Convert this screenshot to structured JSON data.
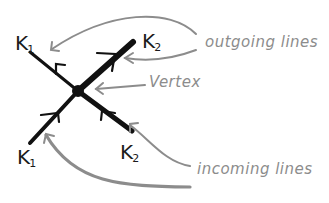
{
  "diagram": {
    "type": "feynman-vertex",
    "colors": {
      "line": "#111111",
      "annotation": "#8c8c8c",
      "background": "#ffffff"
    },
    "vertex": {
      "label": "Vertex",
      "x": 78,
      "y": 91
    },
    "lines": [
      {
        "id": "outgoing-k1",
        "label": "K",
        "subscript": "1",
        "direction": "outgoing",
        "end": {
          "x": 30,
          "y": 52
        }
      },
      {
        "id": "outgoing-k2",
        "label": "K",
        "subscript": "2",
        "direction": "outgoing",
        "end": {
          "x": 133,
          "y": 42
        }
      },
      {
        "id": "incoming-k1",
        "label": "K",
        "subscript": "1",
        "direction": "incoming",
        "end": {
          "x": 30,
          "y": 143
        }
      },
      {
        "id": "incoming-k2",
        "label": "K",
        "subscript": "2",
        "direction": "incoming",
        "end": {
          "x": 132,
          "y": 131
        }
      }
    ],
    "annotations": [
      {
        "id": "outgoing",
        "text": "outgoing lines"
      },
      {
        "id": "vertex",
        "text": "Vertex"
      },
      {
        "id": "incoming",
        "text": "incoming lines"
      }
    ]
  }
}
